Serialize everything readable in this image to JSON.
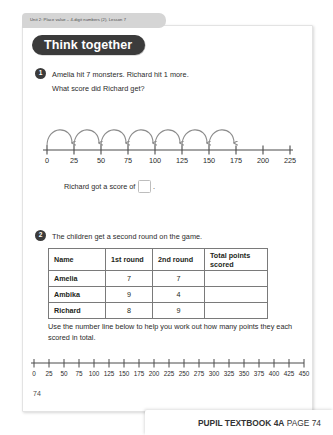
{
  "unit_tab": {
    "label": "Unit 2: Place value – 4-digit numbers (2), Lesson 7"
  },
  "banner": {
    "title": "Think together"
  },
  "questions": [
    {
      "number": "1",
      "lines": [
        "Amelia hit 7 monsters. Richard hit 1 more.",
        "What score did Richard get?"
      ],
      "answer_sentence_before": "Richard got a score of",
      "answer_sentence_after": ".",
      "answer_box_value": ""
    },
    {
      "number": "2",
      "lines": [
        "The children get a second round on the game."
      ]
    }
  ],
  "numberline_top": {
    "ticks": [
      "0",
      "25",
      "50",
      "75",
      "100",
      "125",
      "150",
      "175",
      "200",
      "225"
    ],
    "hops": 7,
    "hop_start_index": 0,
    "line_color": "#4a4a4a",
    "arc_color": "#8c8c8c"
  },
  "table": {
    "headers": [
      "Name",
      "1st round",
      "2nd round",
      "Total points scored"
    ],
    "rows": [
      {
        "name": "Amelia",
        "round1": "7",
        "round2": "7",
        "total": ""
      },
      {
        "name": "Ambika",
        "round1": "9",
        "round2": "4",
        "total": ""
      },
      {
        "name": "Richard",
        "round1": "8",
        "round2": "9",
        "total": ""
      }
    ]
  },
  "instruction": "Use the number line below to help you work out how many points they each scored in total.",
  "numberline_bottom": {
    "ticks": [
      "0",
      "25",
      "50",
      "75",
      "100",
      "125",
      "150",
      "175",
      "200",
      "225",
      "250",
      "275",
      "300",
      "325",
      "350",
      "375",
      "400",
      "425",
      "450"
    ],
    "line_color": "#4a4a4a"
  },
  "page_number": "74",
  "footer": {
    "book": "PUPIL TEXTBOOK 4A",
    "page": "PAGE 74"
  },
  "colors": {
    "banner_bg": "#3b3b3b",
    "tab_bg": "#d5d5d5",
    "table_border": "#7a7a7a",
    "text": "#2b2b2b"
  }
}
